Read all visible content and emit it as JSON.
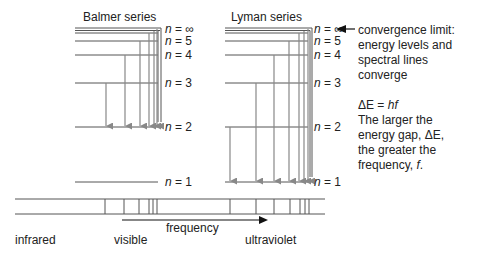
{
  "titles": {
    "balmer": "Balmer series",
    "lyman": "Lyman series"
  },
  "levels": [
    {
      "n": "∞",
      "label": "n = ∞"
    },
    {
      "n": "5",
      "label": "n = 5"
    },
    {
      "n": "4",
      "label": "n = 4"
    },
    {
      "n": "3",
      "label": "n = 3"
    },
    {
      "n": "2",
      "label": "n = 2"
    },
    {
      "n": "1",
      "label": "n = 1"
    }
  ],
  "annotation": {
    "convergence_line1": "convergence limit:",
    "convergence_line2": "energy levels and",
    "convergence_line3": "spectral lines",
    "convergence_line4": "converge",
    "equation_dE": "ΔE",
    "equation_eq": " = ",
    "equation_hf": "hf",
    "explain_line1": "The larger the",
    "explain_line2_a": "energy gap, ",
    "explain_line2_b": "ΔE",
    "explain_line2_c": ",",
    "explain_line3": "the greater the",
    "explain_line4_a": "frequency, ",
    "explain_line4_b": "f",
    "explain_line4_c": "."
  },
  "spectrum": {
    "infrared": "infrared",
    "visible": "visible",
    "ultraviolet": "ultraviolet",
    "frequency": "frequency"
  },
  "colors": {
    "level_line": "#555555",
    "arrow": "#888888",
    "text": "#222222"
  }
}
